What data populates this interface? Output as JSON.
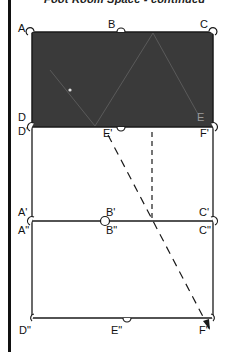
{
  "header": {
    "title": "Foot Room Space - continued"
  },
  "colors": {
    "shaded": "#3a3a3a",
    "line": "#1a1a1a",
    "bar": "#111111"
  },
  "diagram": {
    "upper_rect": {
      "labels": {
        "A": "A",
        "B": "B",
        "C": "C",
        "D": "D",
        "E": "E",
        "F": "F"
      },
      "shaded": true,
      "inner_marks": [
        "zigzag folds",
        "white dot"
      ]
    },
    "middle_rect": {
      "labels": {
        "D1": "D'",
        "E1": "E'",
        "F1": "F'",
        "A1": "A'",
        "B1": "B'",
        "C1": "C'"
      }
    },
    "lower_rect": {
      "labels": {
        "A2": "A\"",
        "B2": "B\"",
        "C2": "C\"",
        "D2": "D\"",
        "E2": "E\"",
        "F2": "F\""
      }
    },
    "arrows": [
      {
        "name": "vertical-dashed",
        "from": "E-region",
        "to": "B'-C' line"
      },
      {
        "name": "diagonal-dashed-arrow",
        "from": "E'",
        "to": "F\""
      }
    ]
  }
}
